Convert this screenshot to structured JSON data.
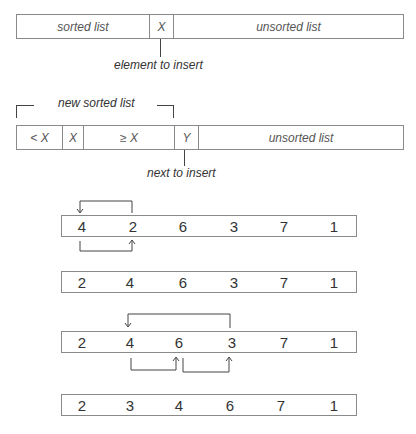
{
  "diagram1": {
    "cells": [
      "sorted list",
      "X",
      "unsorted list"
    ],
    "annotation": "element to insert"
  },
  "diagram2": {
    "bracket_label": "new sorted list",
    "cells": [
      "< X",
      "X",
      "≥ X",
      "Y",
      "unsorted list"
    ],
    "annotation": "next to insert"
  },
  "steps": [
    {
      "values": [
        "4",
        "2",
        "6",
        "3",
        "7",
        "1"
      ]
    },
    {
      "values": [
        "2",
        "4",
        "6",
        "3",
        "7",
        "1"
      ]
    },
    {
      "values": [
        "2",
        "4",
        "6",
        "3",
        "7",
        "1"
      ]
    },
    {
      "values": [
        "2",
        "3",
        "4",
        "6",
        "7",
        "1"
      ]
    }
  ]
}
